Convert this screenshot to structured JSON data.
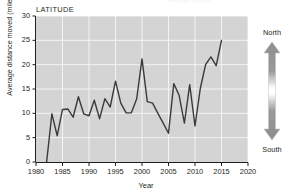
{
  "header": {
    "cropped_text": "Average latitude"
  },
  "panel": {
    "label": "LATITUDE"
  },
  "legend": {
    "north_label": "North",
    "south_label": "South",
    "arrow_icon": "double-headed-vertical-arrow-icon"
  },
  "chart_data": {
    "type": "line",
    "title": "LATITUDE",
    "xlabel": "Year",
    "ylabel": "Average distance moved (miles)",
    "xlim": [
      1980,
      2020
    ],
    "ylim": [
      0,
      30
    ],
    "xticks": [
      1980,
      1985,
      1990,
      1995,
      2000,
      2005,
      2010,
      2015,
      2020
    ],
    "yticks": [
      0,
      5,
      10,
      15,
      20,
      25,
      30
    ],
    "grid": true,
    "plot_background": "#d4d4d4",
    "line_color": "#3a3a3a",
    "legend_position": "right-outside",
    "series": [
      {
        "name": "Average distance moved",
        "x": [
          1982,
          1983,
          1984,
          1985,
          1986,
          1987,
          1988,
          1989,
          1990,
          1991,
          1992,
          1993,
          1994,
          1995,
          1996,
          1997,
          1998,
          1999,
          2000,
          2001,
          2002,
          2003,
          2004,
          2005,
          2006,
          2007,
          2008,
          2009,
          2010,
          2011,
          2012,
          2013,
          2014,
          2015
        ],
        "y": [
          0,
          9.9,
          5.4,
          10.8,
          10.9,
          9.2,
          13.4,
          9.9,
          9.5,
          12.7,
          8.9,
          13.0,
          11.3,
          16.6,
          12.1,
          10.1,
          10.1,
          13.0,
          21.2,
          12.4,
          12.1,
          10.0,
          8.0,
          5.9,
          16.1,
          13.7,
          8.0,
          15.9,
          7.4,
          15.1,
          20.0,
          21.6,
          19.8,
          25.0
        ]
      }
    ]
  }
}
